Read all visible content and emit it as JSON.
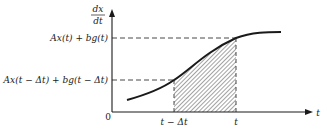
{
  "figure": {
    "axes": {
      "y_label_numerator": "dx",
      "y_label_denominator": "dt",
      "x_label": "t",
      "origin_label": "0"
    },
    "y_levels": {
      "upper": "Ax(t) + bg(t)",
      "lower": "Ax(t − Δt) + bg(t − Δt)"
    },
    "x_ticks": {
      "left": "t − Δt",
      "right": "t"
    },
    "shaded_region": "area under curve between t − Δt and t",
    "colors": {
      "ink": "#1a1a1a",
      "background": "#ffffff"
    }
  }
}
